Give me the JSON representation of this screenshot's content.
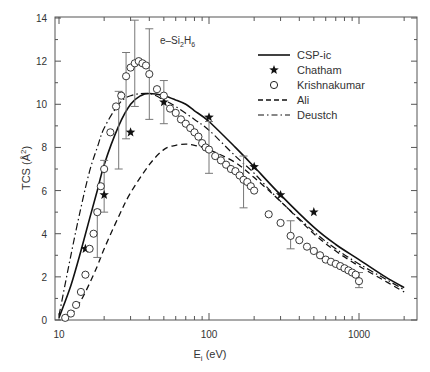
{
  "chart_data": {
    "type": "line",
    "title": "",
    "annotation": "e–Si2H6",
    "xlabel": "Ei (eV)",
    "ylabel": "TCS (Å2)",
    "xscale": "log",
    "xlim": [
      9.4,
      2400
    ],
    "ylim": [
      0,
      14
    ],
    "xticks": [
      10,
      100,
      1000
    ],
    "yticks": [
      0,
      2,
      4,
      6,
      8,
      10,
      12,
      14
    ],
    "grid": false,
    "legend_position": "upper right",
    "legend": [
      "CSP-ic",
      "Chatham",
      "Krishnakumar",
      "Ali",
      "Deustch"
    ],
    "series": [
      {
        "name": "CSP-ic",
        "style": "solid",
        "x": [
          10,
          12,
          14,
          16,
          18,
          20,
          25,
          30,
          35,
          40,
          50,
          60,
          70,
          80,
          100,
          150,
          200,
          300,
          500,
          700,
          1000,
          1500,
          2000
        ],
        "y": [
          0.1,
          1.6,
          3.2,
          4.7,
          6.0,
          7.2,
          9.0,
          10.0,
          10.4,
          10.5,
          10.4,
          10.2,
          10.0,
          9.7,
          9.2,
          8.0,
          7.1,
          5.8,
          4.3,
          3.5,
          2.8,
          2.0,
          1.5
        ]
      },
      {
        "name": "Ali",
        "style": "dashed",
        "x": [
          12,
          14,
          16,
          18,
          20,
          25,
          30,
          40,
          50,
          60,
          70,
          80,
          100,
          150,
          200,
          300,
          500,
          700,
          1000,
          1500,
          2000
        ],
        "y": [
          0.2,
          0.9,
          1.7,
          2.5,
          3.3,
          4.8,
          5.9,
          7.2,
          7.9,
          8.1,
          8.15,
          8.1,
          7.9,
          7.3,
          6.6,
          5.5,
          4.0,
          3.2,
          2.5,
          1.8,
          1.3
        ]
      },
      {
        "name": "Deustch",
        "style": "dash-dot",
        "x": [
          10,
          12,
          14,
          16,
          18,
          20,
          25,
          30,
          40,
          50,
          60,
          80,
          100,
          150,
          200,
          300,
          500,
          700,
          1000,
          1500,
          2000
        ],
        "y": [
          0.2,
          3.0,
          5.2,
          6.9,
          8.0,
          8.9,
          10.0,
          10.4,
          10.5,
          10.2,
          9.9,
          9.3,
          8.8,
          7.6,
          6.8,
          5.5,
          4.1,
          3.3,
          2.6,
          1.9,
          1.4
        ]
      },
      {
        "name": "Chatham",
        "style": "star-markers",
        "x": [
          15,
          20,
          30,
          50,
          100,
          200,
          300,
          500
        ],
        "y": [
          3.3,
          5.8,
          8.7,
          10.1,
          9.4,
          7.1,
          5.8,
          5.0
        ],
        "yerr": [
          0,
          0,
          0,
          0,
          0,
          0,
          0,
          0
        ]
      },
      {
        "name": "Krishnakumar",
        "style": "circle-markers",
        "x": [
          11,
          12,
          13,
          14,
          15,
          16,
          17,
          18,
          19,
          20,
          22,
          24,
          26,
          28,
          30,
          32,
          34,
          36,
          38,
          40,
          45,
          50,
          55,
          60,
          65,
          70,
          75,
          80,
          85,
          90,
          95,
          100,
          110,
          120,
          130,
          140,
          150,
          160,
          170,
          180,
          190,
          200,
          250,
          300,
          350,
          400,
          450,
          500,
          550,
          600,
          650,
          700,
          750,
          800,
          850,
          900,
          950,
          1000
        ],
        "y": [
          0.1,
          0.3,
          0.7,
          1.3,
          2.1,
          3.3,
          4.0,
          5.0,
          6.2,
          7.0,
          8.7,
          9.9,
          10.4,
          11.3,
          11.7,
          11.9,
          12.0,
          11.9,
          11.8,
          11.4,
          10.7,
          10.4,
          9.8,
          9.6,
          9.3,
          9.1,
          8.9,
          8.7,
          8.5,
          8.2,
          8.0,
          7.9,
          7.6,
          7.4,
          7.2,
          7.0,
          6.9,
          6.7,
          6.5,
          6.4,
          6.2,
          6.0,
          4.9,
          4.5,
          3.9,
          3.7,
          3.4,
          3.2,
          3.0,
          2.8,
          2.7,
          2.6,
          2.5,
          2.4,
          2.3,
          2.2,
          2.1,
          1.8
        ],
        "errorbars": [
          {
            "x": 18,
            "y": 4.0,
            "low": 2.9,
            "high": 5.1
          },
          {
            "x": 20,
            "y": 6.2,
            "low": 5.0,
            "high": 7.4
          },
          {
            "x": 25,
            "y": 8.8,
            "low": 7.0,
            "high": 10.6
          },
          {
            "x": 28,
            "y": 10.3,
            "low": 8.4,
            "high": 12.4
          },
          {
            "x": 32,
            "y": 11.9,
            "low": 9.9,
            "high": 13.9
          },
          {
            "x": 40,
            "y": 11.4,
            "low": 9.3,
            "high": 13.5
          },
          {
            "x": 50,
            "y": 10.4,
            "low": 9.1,
            "high": 11.1
          },
          {
            "x": 100,
            "y": 8.0,
            "low": 6.8,
            "high": 9.2
          },
          {
            "x": 170,
            "y": 6.4,
            "low": 5.2,
            "high": 7.6
          },
          {
            "x": 350,
            "y": 3.9,
            "low": 3.3,
            "high": 4.6
          },
          {
            "x": 1000,
            "y": 1.8,
            "low": 1.5,
            "high": 2.2
          }
        ]
      }
    ]
  },
  "labels": {
    "annotation_main": "e–Si",
    "annotation_sub1": "2",
    "annotation_mid": "H",
    "annotation_sub2": "6",
    "xlabel_main": "E",
    "xlabel_sub": "i",
    "xlabel_unit": " (eV)",
    "ylabel_main": "TCS (Å",
    "ylabel_sup": "2",
    "ylabel_end": ")"
  }
}
